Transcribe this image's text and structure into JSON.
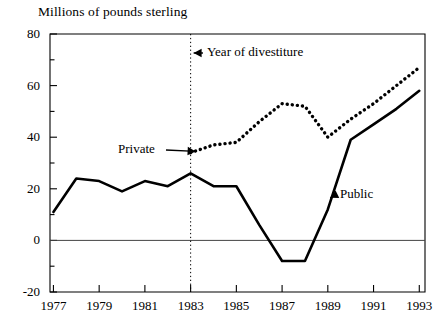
{
  "chart_data": {
    "type": "line",
    "title": "",
    "ylabel": "Millions of pounds sterling",
    "xlabel": "",
    "ylim": [
      -20,
      80
    ],
    "xlim": [
      1977,
      1993
    ],
    "yticks": [
      80,
      60,
      40,
      20,
      0,
      -20
    ],
    "ytick_labels": [
      "80",
      "60",
      "40",
      "20",
      "0",
      "-20"
    ],
    "yminor_ticks": [
      70,
      50,
      30,
      10,
      -10
    ],
    "xticks": [
      1977,
      1979,
      1981,
      1983,
      1985,
      1987,
      1989,
      1991,
      1993
    ],
    "xtick_labels": [
      "1977",
      "1979",
      "1981",
      "1983",
      "1985",
      "1987",
      "1989",
      "1991",
      "1993"
    ],
    "x_all_years": [
      1977,
      1978,
      1979,
      1980,
      1981,
      1982,
      1983,
      1984,
      1985,
      1986,
      1987,
      1988,
      1989,
      1990,
      1991,
      1992,
      1993
    ],
    "grid": false,
    "zero_line": true,
    "legend_position": "inline-annotations",
    "series": [
      {
        "name": "Public",
        "style": "solid",
        "color": "#000000",
        "x": [
          1977,
          1978,
          1979,
          1980,
          1981,
          1982,
          1983,
          1984,
          1985,
          1986,
          1987,
          1988,
          1989,
          1990,
          1991,
          1992,
          1993
        ],
        "values": [
          11,
          24,
          23,
          19,
          23,
          21,
          26,
          21,
          21,
          6,
          -8,
          -8,
          12,
          39,
          45,
          51,
          58
        ]
      },
      {
        "name": "Private",
        "style": "dotted",
        "color": "#000000",
        "x": [
          1983,
          1984,
          1985,
          1986,
          1987,
          1988,
          1989,
          1990,
          1991,
          1992,
          1993
        ],
        "values": [
          34,
          37,
          38,
          46,
          53,
          52,
          40,
          47,
          53,
          60,
          67
        ]
      }
    ],
    "annotations": [
      {
        "name": "year-of-divestiture",
        "text": "Year of divestiture",
        "target_x": 1983,
        "label_x": 207,
        "label_y": 44,
        "arrow": "left",
        "vertical_rule": true
      },
      {
        "name": "private-label",
        "text": "Private",
        "label_x": 118,
        "label_y": 141,
        "arrow": "right"
      },
      {
        "name": "public-label",
        "text": "Public",
        "label_x": 340,
        "label_y": 186,
        "arrow": "left"
      }
    ]
  },
  "geometry": {
    "plot_left": 50,
    "plot_right": 425,
    "plot_top": 34,
    "plot_bottom": 292,
    "y_value_top": 80,
    "y_value_bottom": -20,
    "x_value_left": 1976.85,
    "x_value_right": 1993.25
  }
}
